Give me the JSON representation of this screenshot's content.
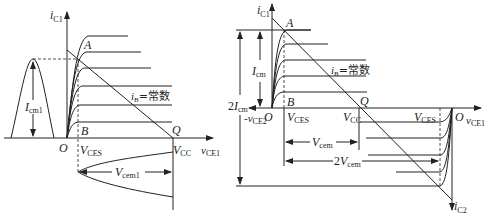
{
  "left": {
    "y_axis_label": "i",
    "y_axis_sub": "C1",
    "x_axis_label": "v",
    "x_axis_sub": "CE1",
    "point_A": "A",
    "point_B": "B",
    "point_Q": "Q",
    "origin": "O",
    "vces_label": "V",
    "vces_sub": "CES",
    "vcc_label": "V",
    "vcc_sub": "CC",
    "ib_label": "i",
    "ib_sub": "B",
    "ib_text": "=常数",
    "icm_label": "I",
    "icm_sub": "cm1",
    "vcem_label": "V",
    "vcem_sub": "cem1"
  },
  "right": {
    "y_axis_label": "i",
    "y_axis_sub": "C1",
    "x_axis_label": "v",
    "x_axis_sub": "CE1",
    "neg_x_label": "-v",
    "neg_x_sub": "CE2",
    "y2_axis_label": "i",
    "y2_axis_sub": "C2",
    "point_A": "A",
    "point_B": "B",
    "point_Q": "Q",
    "origin": "O",
    "origin2": "O",
    "vces_label": "V",
    "vces_sub": "CES",
    "vces2_label": "V",
    "vces2_sub": "CES",
    "vcc_label": "V",
    "vcc_sub": "CC",
    "ib_label": "i",
    "ib_sub": "B",
    "ib_text": "=常数",
    "icm_label": "I",
    "icm_sub": "cm",
    "icm2_prefix": "2",
    "icm2_label": "I",
    "icm2_sub": "cm",
    "vcem_label": "V",
    "vcem_sub": "cem",
    "vcem2_prefix": "2",
    "vcem2_label": "V",
    "vcem2_sub": "cem"
  }
}
